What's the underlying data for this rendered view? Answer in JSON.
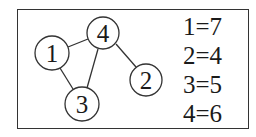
{
  "diagram": {
    "type": "graph",
    "nodes": [
      {
        "id": "1",
        "label": "1",
        "cx": 52,
        "cy": 53,
        "r": 17
      },
      {
        "id": "4",
        "label": "4",
        "cx": 103,
        "cy": 33,
        "r": 16
      },
      {
        "id": "2",
        "label": "2",
        "cx": 146,
        "cy": 80,
        "r": 16
      },
      {
        "id": "3",
        "label": "3",
        "cx": 82,
        "cy": 104,
        "r": 17
      }
    ],
    "edges": [
      {
        "from": "1",
        "to": "4"
      },
      {
        "from": "1",
        "to": "3"
      },
      {
        "from": "4",
        "to": "3"
      },
      {
        "from": "4",
        "to": "2"
      }
    ]
  },
  "legend": {
    "items": [
      {
        "text": "1=7"
      },
      {
        "text": "2=4"
      },
      {
        "text": "3=5"
      },
      {
        "text": "4=6"
      }
    ]
  },
  "colors": {
    "stroke": "#333333",
    "text": "#1a1a1a",
    "background": "#ffffff"
  }
}
